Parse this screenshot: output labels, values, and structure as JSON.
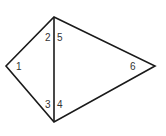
{
  "diagram": {
    "type": "quadrilateral-with-diagonal",
    "vertices": {
      "top": [
        54,
        17
      ],
      "left": [
        6,
        66
      ],
      "bottom": [
        54,
        122
      ],
      "right": [
        155,
        66
      ]
    },
    "angle_labels": [
      {
        "text": "1",
        "x": 16,
        "y": 70
      },
      {
        "text": "2",
        "x": 45,
        "y": 41
      },
      {
        "text": "5",
        "x": 57,
        "y": 41
      },
      {
        "text": "6",
        "x": 130,
        "y": 70
      },
      {
        "text": "3",
        "x": 45,
        "y": 108
      },
      {
        "text": "4",
        "x": 57,
        "y": 108
      }
    ],
    "colors": {
      "stroke": "#1a1a1a",
      "label": "#333333",
      "background": "#ffffff"
    }
  }
}
